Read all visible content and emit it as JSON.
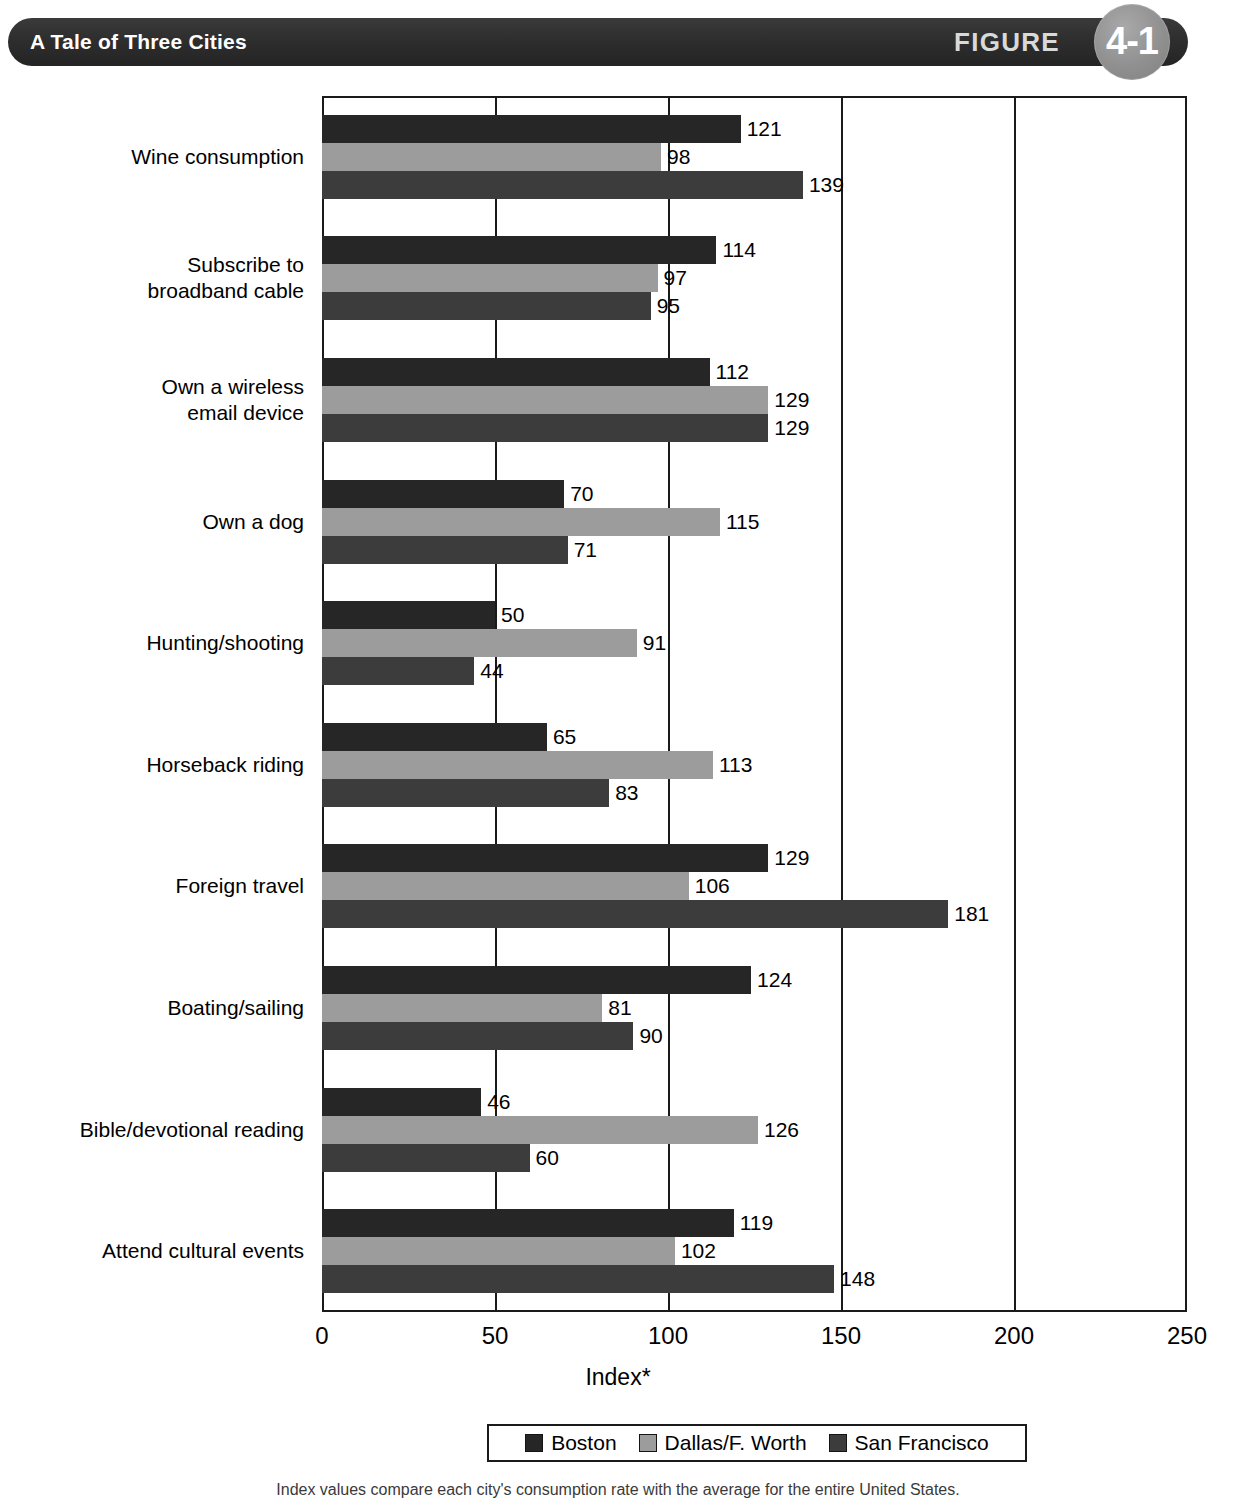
{
  "header": {
    "title": "A Tale of Three Cities",
    "figure_word": "FIGURE",
    "figure_number": "4-1"
  },
  "legend": {
    "entries": [
      {
        "label": "Boston",
        "color": "#262626"
      },
      {
        "label": "Dallas/F. Worth",
        "color": "#9c9c9c"
      },
      {
        "label": "San Francisco",
        "color": "#3c3c3c"
      }
    ]
  },
  "footnote": "Index values compare each city's consumption rate with the average for the entire United States.",
  "chart_data": {
    "type": "bar",
    "orientation": "horizontal",
    "title": "A Tale of Three Cities",
    "xlabel": "Index*",
    "ylabel": "",
    "xlim": [
      0,
      250
    ],
    "xticks": [
      0,
      50,
      100,
      150,
      200,
      250
    ],
    "xtick_labels": [
      "0",
      "50",
      "100",
      "150",
      "200",
      "250"
    ],
    "grid": true,
    "grid_axis": "x",
    "legend_position": "bottom",
    "categories": [
      "Wine consumption",
      "Subscribe to\nbroadband cable",
      "Own a wireless\nemail device",
      "Own a dog",
      "Hunting/shooting",
      "Horseback riding",
      "Foreign travel",
      "Boating/sailing",
      "Bible/devotional reading",
      "Attend cultural events"
    ],
    "series": [
      {
        "name": "Boston",
        "color": "#262626",
        "values": [
          121,
          114,
          112,
          70,
          50,
          65,
          129,
          124,
          46,
          119
        ]
      },
      {
        "name": "Dallas/F. Worth",
        "color": "#9c9c9c",
        "values": [
          98,
          97,
          129,
          115,
          91,
          113,
          106,
          81,
          126,
          102
        ]
      },
      {
        "name": "San Francisco",
        "color": "#3c3c3c",
        "values": [
          139,
          95,
          129,
          71,
          44,
          83,
          181,
          90,
          60,
          148
        ]
      }
    ]
  }
}
